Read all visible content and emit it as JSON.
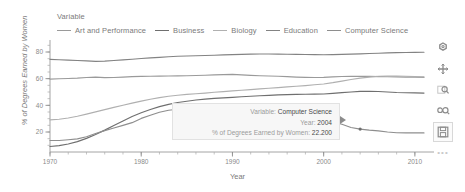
{
  "legend": {
    "title": "Variable",
    "items": [
      {
        "label": "Art and Performance",
        "color": "#9a9a9a"
      },
      {
        "label": "Business",
        "color": "#6f6f6f"
      },
      {
        "label": "Biology",
        "color": "#b0b0b0"
      },
      {
        "label": "Education",
        "color": "#838383"
      },
      {
        "label": "Computer Science",
        "color": "#8e8e8e"
      }
    ]
  },
  "tooltip": {
    "variable_key": "Variable:",
    "variable_value": "Computer Science",
    "year_key": "Year:",
    "year_value": "2004",
    "pct_key": "% of Degrees Earned by Women:",
    "pct_value": "22.200"
  },
  "toolbar": {
    "items": [
      {
        "name": "reset-icon",
        "label": "reset"
      },
      {
        "name": "pan-icon",
        "label": "pan"
      },
      {
        "name": "zoom-in-icon",
        "label": "zoom in"
      },
      {
        "name": "zoom-out-icon",
        "label": "zoom out"
      },
      {
        "name": "save-icon",
        "label": "save"
      },
      {
        "name": "more-icon",
        "label": "..."
      }
    ]
  },
  "chart_data": {
    "type": "line",
    "title": "",
    "xlabel": "Year",
    "ylabel": "% of Degrees Earned by Women",
    "xlim": [
      1970,
      2011
    ],
    "ylim": [
      5,
      86
    ],
    "xticks": [
      1970,
      1980,
      1990,
      2000,
      2010
    ],
    "yticks": [
      20,
      40,
      60,
      80
    ],
    "minor_tick_step": 2,
    "grid": false,
    "legend_position": "top-left",
    "x": [
      1970,
      1971,
      1972,
      1973,
      1974,
      1975,
      1976,
      1977,
      1978,
      1979,
      1980,
      1981,
      1982,
      1983,
      1984,
      1985,
      1986,
      1987,
      1988,
      1989,
      1990,
      1991,
      1992,
      1993,
      1994,
      1995,
      1996,
      1997,
      1998,
      1999,
      2000,
      2001,
      2002,
      2003,
      2004,
      2005,
      2006,
      2007,
      2008,
      2009,
      2010,
      2011
    ],
    "series": [
      {
        "name": "Education",
        "color": "#838383",
        "values": [
          74.5,
          74.2,
          73.9,
          73.6,
          73.3,
          73.0,
          73.2,
          73.6,
          74.1,
          74.6,
          75.1,
          75.6,
          76.0,
          76.4,
          76.8,
          77.0,
          77.2,
          77.4,
          77.6,
          77.8,
          78.0,
          78.2,
          78.4,
          78.5,
          78.5,
          78.4,
          78.3,
          78.2,
          78.1,
          78.0,
          77.9,
          78.0,
          78.2,
          78.4,
          78.6,
          78.9,
          79.1,
          79.3,
          79.5,
          79.6,
          79.7,
          79.8
        ]
      },
      {
        "name": "Art and Performance",
        "color": "#9a9a9a",
        "values": [
          59.7,
          59.9,
          60.1,
          60.4,
          60.9,
          61.2,
          60.8,
          60.9,
          61.2,
          61.5,
          61.7,
          61.8,
          61.9,
          62.0,
          62.1,
          62.2,
          62.4,
          62.6,
          62.8,
          63.0,
          63.2,
          62.8,
          62.5,
          62.2,
          62.0,
          61.8,
          61.5,
          61.2,
          61.0,
          60.9,
          61.0,
          61.3,
          61.6,
          61.7,
          61.8,
          61.7,
          61.5,
          61.4,
          61.3,
          61.2,
          61.1,
          61.0
        ]
      },
      {
        "name": "Biology",
        "color": "#b0b0b0",
        "values": [
          29.1,
          29.6,
          30.5,
          31.8,
          33.4,
          35.1,
          36.8,
          38.5,
          40.1,
          41.7,
          43.2,
          44.6,
          45.8,
          46.8,
          47.6,
          48.2,
          48.7,
          49.2,
          49.8,
          50.3,
          50.8,
          51.3,
          51.8,
          52.3,
          52.8,
          53.3,
          53.8,
          54.3,
          54.8,
          55.4,
          56.0,
          57.0,
          58.2,
          59.4,
          60.4,
          61.2,
          61.8,
          62.0,
          62.0,
          61.8,
          61.5,
          61.3
        ]
      },
      {
        "name": "Business",
        "color": "#6f6f6f",
        "values": [
          9.1,
          9.8,
          11.0,
          12.8,
          15.2,
          18.1,
          21.4,
          24.9,
          28.3,
          31.6,
          34.4,
          36.9,
          39.0,
          40.7,
          42.1,
          43.1,
          44.0,
          44.7,
          45.2,
          45.6,
          46.0,
          46.4,
          46.8,
          47.2,
          47.5,
          47.8,
          48.0,
          48.2,
          48.3,
          48.4,
          48.5,
          49.0,
          49.5,
          50.0,
          50.5,
          50.6,
          50.4,
          50.0,
          49.6,
          49.4,
          49.3,
          49.2
        ]
      },
      {
        "name": "Computer Science",
        "color": "#8e8e8e",
        "values": [
          13.6,
          13.6,
          14.2,
          14.8,
          16.4,
          18.9,
          21.0,
          23.0,
          25.0,
          27.0,
          30.2,
          32.5,
          34.8,
          36.3,
          37.1,
          36.8,
          35.7,
          34.7,
          32.4,
          30.8,
          29.9,
          29.4,
          28.7,
          28.2,
          28.5,
          28.5,
          27.5,
          26.8,
          27.0,
          27.8,
          28.1,
          27.5,
          25.8,
          23.4,
          22.2,
          21.4,
          20.8,
          20.0,
          19.4,
          19.3,
          19.3,
          19.3
        ]
      }
    ],
    "highlight_point": {
      "series": "Computer Science",
      "x": 2004,
      "y": 22.2
    }
  }
}
